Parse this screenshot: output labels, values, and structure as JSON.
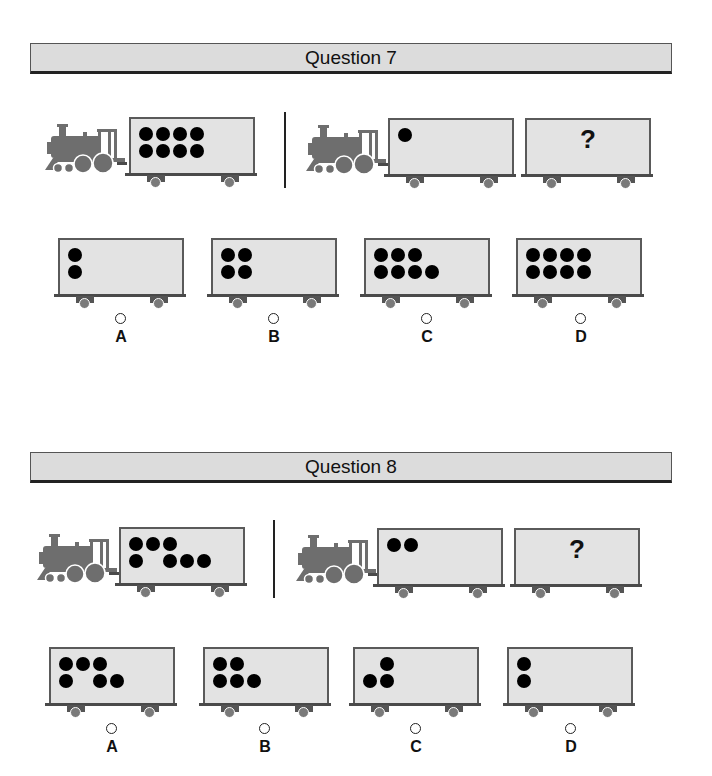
{
  "questions": [
    {
      "title": "Question 7",
      "prompt": {
        "left_train": {
          "cars": [
            {
              "dots": [
                [
                  1,
                  1,
                  1,
                  1
                ],
                [
                  1,
                  1,
                  1,
                  1
                ]
              ]
            }
          ]
        },
        "right_train": {
          "cars": [
            {
              "dots": [
                [
                  1
                ]
              ]
            },
            {
              "unknown": "?"
            }
          ]
        }
      },
      "options": [
        {
          "label": "A",
          "dots": [
            [
              1
            ],
            [
              1
            ]
          ]
        },
        {
          "label": "B",
          "dots": [
            [
              1,
              1
            ],
            [
              1,
              1
            ]
          ]
        },
        {
          "label": "C",
          "dots": [
            [
              1,
              1,
              1
            ],
            [
              1,
              1,
              1,
              1
            ]
          ]
        },
        {
          "label": "D",
          "dots": [
            [
              1,
              1,
              1,
              1
            ],
            [
              1,
              1,
              1,
              1
            ]
          ]
        }
      ]
    },
    {
      "title": "Question 8",
      "prompt": {
        "left_train": {
          "cars": [
            {
              "dots": [
                [
                  1,
                  1,
                  1
                ],
                [
                  1,
                  0,
                  1,
                  1,
                  1
                ]
              ]
            }
          ]
        },
        "right_train": {
          "cars": [
            {
              "dots": [
                [
                  1,
                  1
                ]
              ]
            },
            {
              "unknown": "?"
            }
          ]
        }
      },
      "options": [
        {
          "label": "A",
          "dots": [
            [
              1,
              1,
              1
            ],
            [
              1,
              0,
              1,
              1
            ]
          ]
        },
        {
          "label": "B",
          "dots": [
            [
              1,
              1
            ],
            [
              1,
              1,
              1
            ]
          ]
        },
        {
          "label": "C",
          "dots": [
            [
              0,
              1
            ],
            [
              1,
              1
            ]
          ]
        },
        {
          "label": "D",
          "dots": [
            [
              1
            ],
            [
              1
            ]
          ]
        }
      ]
    }
  ],
  "colors": {
    "header_bg": "#dcdcdc",
    "car_bg": "#e3e3e3",
    "engine": "#6e6e6e",
    "dot": "#000000"
  },
  "icons": {
    "engine": "steam-locomotive-icon",
    "radio": "radio-button-icon"
  }
}
